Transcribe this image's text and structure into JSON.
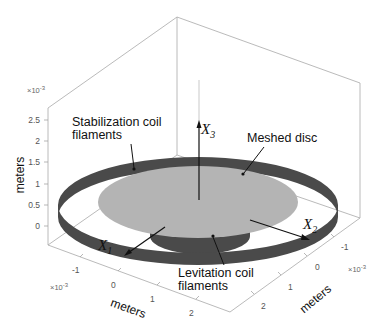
{
  "figure": {
    "z_axis": {
      "label": "meters",
      "exponent": "×10",
      "exponent_power": "-3",
      "ticks": [
        "2.5",
        "2",
        "1.5",
        "1",
        "0.5",
        "0"
      ]
    },
    "x_axis": {
      "label": "meters",
      "exponent": "×10",
      "exponent_power": "-3",
      "ticks": [
        "-1",
        "0",
        "1",
        "2"
      ]
    },
    "y_axis": {
      "label": "meters",
      "exponent": "×10",
      "exponent_power": "-3",
      "ticks": [
        "-1",
        "0",
        "1",
        "2"
      ]
    },
    "vectors": {
      "x1": {
        "base": "X",
        "sub": "1"
      },
      "x2": {
        "base": "X",
        "sub": "2"
      },
      "x3": {
        "base": "X",
        "sub": "3"
      }
    },
    "annotations": {
      "stabilization_line1": "Stabilization coil",
      "stabilization_line2": "filaments",
      "meshed_disc": "Meshed disc",
      "levitation_line1": "Levitation coil",
      "levitation_line2": "filaments"
    },
    "colors": {
      "coil": "#4a4a4a",
      "disc": "#b4b4b4",
      "box": "#a0a0a0"
    }
  }
}
